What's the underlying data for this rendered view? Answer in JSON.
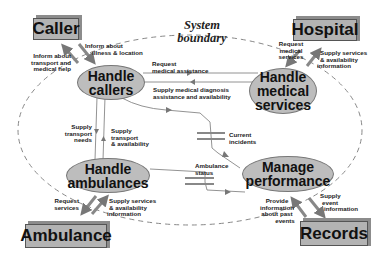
{
  "title": {
    "line1": "System",
    "line2": "boundary"
  },
  "externals": {
    "caller": "Caller",
    "hospital": "Hospital",
    "ambulance": "Ambulance",
    "records": "Records"
  },
  "processes": {
    "handle_callers": {
      "line1": "Handle",
      "line2": "callers"
    },
    "handle_medical": {
      "line1": "Handle",
      "line2": "medical",
      "line3": "services"
    },
    "handle_ambulances": {
      "line1": "Handle",
      "line2": "ambulances"
    },
    "manage_performance": {
      "line1": "Manage",
      "line2": "performance"
    }
  },
  "stores": {
    "current_incidents": {
      "line1": "Current",
      "line2": "incidents"
    },
    "ambulance_status": {
      "line1": "Ambulance",
      "line2": "status"
    }
  },
  "flows": {
    "inform_transport": {
      "line1": "Inform about",
      "line2": "transport and",
      "line3": "medical help"
    },
    "inform_illness": {
      "line1": "Inform about",
      "line2": "illness & location"
    },
    "request_medical_services": {
      "line1": "Request",
      "line2": "medical",
      "line3": "services"
    },
    "hospital_supply": {
      "line1": "Supply services",
      "line2": "& availability",
      "line3": "information"
    },
    "request_medical_assistance": {
      "line1": "Request",
      "line2": "medical assistance"
    },
    "supply_diagnosis": {
      "line1": "Supply medical diagnosis",
      "line2": "assistance and availability"
    },
    "supply_transport_needs": {
      "line1": "Supply",
      "line2": "transport",
      "line3": "needs"
    },
    "supply_transport_avail": {
      "line1": "Supply",
      "line2": "transport",
      "line3": "& availability"
    },
    "request_services": {
      "line1": "Request",
      "line2": "services"
    },
    "ambulance_supply": {
      "line1": "Supply services",
      "line2": "& availability",
      "line3": "information"
    },
    "provide_past_events": {
      "line1": "Provide",
      "line2": "information",
      "line3": "about past",
      "line4": "events"
    },
    "supply_event_info": {
      "line1": "Supply",
      "line2": "event",
      "line3": "information"
    }
  },
  "colors": {
    "box": "#b3b3b3",
    "ellipse": "#bdbdbd",
    "flow_line": "#777777",
    "boundary": "#888888"
  }
}
